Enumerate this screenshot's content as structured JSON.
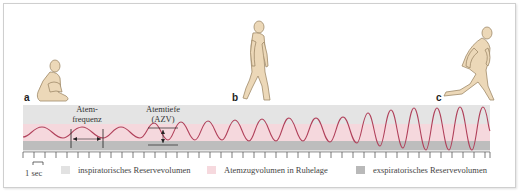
{
  "figure": {
    "panels": [
      {
        "letter": "a",
        "activity": "sitting"
      },
      {
        "letter": "b",
        "activity": "walking"
      },
      {
        "letter": "c",
        "activity": "running"
      }
    ],
    "annotations": {
      "frequency_line1": "Atem-",
      "frequency_line2": "frequenz",
      "depth_line1": "Atemtiefe",
      "depth_line2": "(AZV)"
    },
    "scale_label": "1 sec",
    "legend": [
      {
        "label": "inspiratorisches Reservevolumen",
        "color": "#e2e2e2"
      },
      {
        "label": "Atemzugvolumen in Ruhelage",
        "color": "#f6d9de"
      },
      {
        "label": "exspiratorisches Reservevolumen",
        "color": "#b9b9b9"
      }
    ],
    "colors": {
      "curve": "#b0405a",
      "figure_fill": "#ecd8b8",
      "figure_stroke": "#a08a6a",
      "band_top": "#e4e4e4",
      "band_mid": "#f5d8dd",
      "band_bottom": "#bdbdbd"
    }
  }
}
